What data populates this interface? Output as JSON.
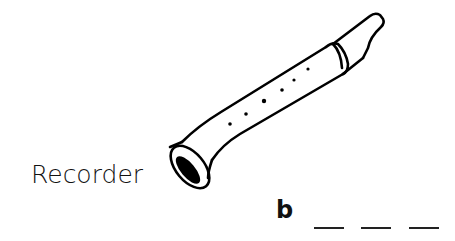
{
  "label": "Recorder",
  "answer": {
    "first_letter": "b",
    "blank_count": 3
  },
  "illustration": "recorder-icon"
}
